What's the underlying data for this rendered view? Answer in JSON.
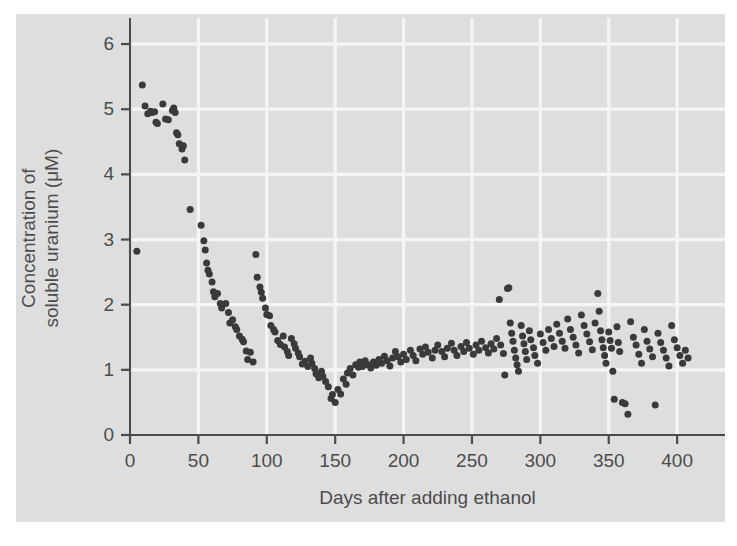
{
  "figure": {
    "background_color": "#ffffff",
    "panel_color": "#dedede",
    "grid_color": "#f5f5f5",
    "axis_color": "#4c4c4c",
    "point_color": "#3a3a3a"
  },
  "axes": {
    "x_title": "Days after adding ethanol",
    "y_title_line1": "Concentration of",
    "y_title_line2": "soluble uranium (μM)",
    "x_ticks": [
      "0",
      "50",
      "100",
      "150",
      "200",
      "250",
      "300",
      "350",
      "400"
    ],
    "y_ticks": [
      "0",
      "1",
      "2",
      "3",
      "4",
      "5",
      "6"
    ]
  },
  "chart_data": {
    "type": "scatter",
    "title": "",
    "xlabel": "Days after adding ethanol",
    "ylabel": "Concentration of soluble uranium (μM)",
    "xlim": [
      0,
      435
    ],
    "ylim": [
      0,
      6.4
    ],
    "xticks": [
      0,
      50,
      100,
      150,
      200,
      250,
      300,
      350,
      400
    ],
    "yticks": [
      0,
      1,
      2,
      3,
      4,
      5,
      6
    ],
    "grid": true,
    "legend": null,
    "marker": "filled-circle",
    "marker_size_px": 7,
    "series": [
      {
        "name": "soluble uranium",
        "color": "#3a3a3a",
        "points": [
          [
            5,
            2.82
          ],
          [
            9,
            5.37
          ],
          [
            11,
            5.05
          ],
          [
            13,
            4.93
          ],
          [
            15,
            4.97
          ],
          [
            16,
            4.95
          ],
          [
            18,
            4.96
          ],
          [
            19,
            4.8
          ],
          [
            20,
            4.78
          ],
          [
            24,
            5.08
          ],
          [
            26,
            4.85
          ],
          [
            28,
            4.84
          ],
          [
            31,
            4.98
          ],
          [
            32,
            5.02
          ],
          [
            33,
            4.95
          ],
          [
            34,
            4.64
          ],
          [
            35,
            4.61
          ],
          [
            36,
            4.47
          ],
          [
            38,
            4.39
          ],
          [
            39,
            4.44
          ],
          [
            40,
            4.22
          ],
          [
            44,
            3.46
          ],
          [
            52,
            3.22
          ],
          [
            54,
            2.98
          ],
          [
            55,
            2.84
          ],
          [
            56,
            2.64
          ],
          [
            57,
            2.53
          ],
          [
            58,
            2.47
          ],
          [
            60,
            2.35
          ],
          [
            61,
            2.2
          ],
          [
            62,
            2.12
          ],
          [
            64,
            2.17
          ],
          [
            66,
            2.02
          ],
          [
            67,
            1.95
          ],
          [
            70,
            2.02
          ],
          [
            72,
            1.88
          ],
          [
            73,
            1.72
          ],
          [
            75,
            1.77
          ],
          [
            77,
            1.66
          ],
          [
            78,
            1.62
          ],
          [
            80,
            1.52
          ],
          [
            82,
            1.47
          ],
          [
            83,
            1.43
          ],
          [
            85,
            1.29
          ],
          [
            86,
            1.16
          ],
          [
            88,
            1.27
          ],
          [
            90,
            1.12
          ],
          [
            92,
            2.77
          ],
          [
            93,
            2.42
          ],
          [
            95,
            2.27
          ],
          [
            96,
            2.19
          ],
          [
            97,
            2.1
          ],
          [
            99,
            1.95
          ],
          [
            100,
            1.85
          ],
          [
            102,
            1.83
          ],
          [
            103,
            1.68
          ],
          [
            105,
            1.62
          ],
          [
            106,
            1.58
          ],
          [
            108,
            1.45
          ],
          [
            110,
            1.39
          ],
          [
            112,
            1.52
          ],
          [
            113,
            1.35
          ],
          [
            115,
            1.28
          ],
          [
            116,
            1.22
          ],
          [
            118,
            1.48
          ],
          [
            120,
            1.4
          ],
          [
            121,
            1.33
          ],
          [
            123,
            1.26
          ],
          [
            124,
            1.2
          ],
          [
            126,
            1.09
          ],
          [
            128,
            1.13
          ],
          [
            130,
            1.05
          ],
          [
            132,
            1.18
          ],
          [
            133,
            1.1
          ],
          [
            135,
            1.02
          ],
          [
            136,
            0.94
          ],
          [
            138,
            0.88
          ],
          [
            140,
            0.98
          ],
          [
            141,
            0.9
          ],
          [
            143,
            0.82
          ],
          [
            145,
            0.74
          ],
          [
            147,
            0.56
          ],
          [
            148,
            0.62
          ],
          [
            150,
            0.5
          ],
          [
            152,
            0.7
          ],
          [
            154,
            0.63
          ],
          [
            156,
            0.86
          ],
          [
            158,
            0.78
          ],
          [
            159,
            0.95
          ],
          [
            161,
            1.02
          ],
          [
            163,
            0.92
          ],
          [
            165,
            1.08
          ],
          [
            167,
            1.04
          ],
          [
            168,
            1.12
          ],
          [
            170,
            1.05
          ],
          [
            172,
            1.14
          ],
          [
            174,
            1.08
          ],
          [
            176,
            1.03
          ],
          [
            178,
            1.12
          ],
          [
            180,
            1.07
          ],
          [
            182,
            1.16
          ],
          [
            184,
            1.1
          ],
          [
            186,
            1.21
          ],
          [
            188,
            1.14
          ],
          [
            190,
            1.06
          ],
          [
            192,
            1.18
          ],
          [
            194,
            1.28
          ],
          [
            196,
            1.2
          ],
          [
            198,
            1.12
          ],
          [
            200,
            1.24
          ],
          [
            202,
            1.16
          ],
          [
            205,
            1.3
          ],
          [
            207,
            1.22
          ],
          [
            209,
            1.14
          ],
          [
            212,
            1.32
          ],
          [
            214,
            1.24
          ],
          [
            216,
            1.35
          ],
          [
            218,
            1.27
          ],
          [
            221,
            1.18
          ],
          [
            223,
            1.3
          ],
          [
            225,
            1.38
          ],
          [
            228,
            1.28
          ],
          [
            230,
            1.2
          ],
          [
            232,
            1.33
          ],
          [
            235,
            1.41
          ],
          [
            237,
            1.3
          ],
          [
            239,
            1.22
          ],
          [
            242,
            1.36
          ],
          [
            244,
            1.28
          ],
          [
            246,
            1.42
          ],
          [
            248,
            1.33
          ],
          [
            251,
            1.24
          ],
          [
            253,
            1.38
          ],
          [
            255,
            1.3
          ],
          [
            257,
            1.44
          ],
          [
            260,
            1.34
          ],
          [
            262,
            1.26
          ],
          [
            264,
            1.4
          ],
          [
            266,
            1.32
          ],
          [
            268,
            1.48
          ],
          [
            270,
            2.08
          ],
          [
            271,
            1.38
          ],
          [
            273,
            1.25
          ],
          [
            274,
            0.92
          ],
          [
            276,
            2.25
          ],
          [
            277,
            2.26
          ],
          [
            278,
            1.72
          ],
          [
            279,
            1.56
          ],
          [
            280,
            1.44
          ],
          [
            281,
            1.3
          ],
          [
            282,
            1.18
          ],
          [
            283,
            1.08
          ],
          [
            284,
            0.98
          ],
          [
            286,
            1.68
          ],
          [
            287,
            1.52
          ],
          [
            288,
            1.4
          ],
          [
            289,
            1.28
          ],
          [
            290,
            1.16
          ],
          [
            292,
            1.6
          ],
          [
            293,
            1.46
          ],
          [
            295,
            1.34
          ],
          [
            296,
            1.22
          ],
          [
            298,
            1.1
          ],
          [
            300,
            1.55
          ],
          [
            302,
            1.42
          ],
          [
            304,
            1.3
          ],
          [
            306,
            1.62
          ],
          [
            308,
            1.48
          ],
          [
            310,
            1.36
          ],
          [
            312,
            1.7
          ],
          [
            314,
            1.56
          ],
          [
            316,
            1.44
          ],
          [
            318,
            1.33
          ],
          [
            320,
            1.78
          ],
          [
            322,
            1.62
          ],
          [
            324,
            1.5
          ],
          [
            326,
            1.38
          ],
          [
            328,
            1.26
          ],
          [
            330,
            1.84
          ],
          [
            332,
            1.68
          ],
          [
            334,
            1.55
          ],
          [
            336,
            1.43
          ],
          [
            338,
            1.31
          ],
          [
            340,
            1.72
          ],
          [
            342,
            2.17
          ],
          [
            343,
            1.9
          ],
          [
            344,
            1.6
          ],
          [
            345,
            1.46
          ],
          [
            346,
            1.34
          ],
          [
            347,
            1.22
          ],
          [
            348,
            1.1
          ],
          [
            350,
            1.58
          ],
          [
            351,
            1.45
          ],
          [
            352,
            1.33
          ],
          [
            353,
            0.98
          ],
          [
            354,
            0.55
          ],
          [
            356,
            1.66
          ],
          [
            357,
            1.42
          ],
          [
            358,
            1.28
          ],
          [
            360,
            0.5
          ],
          [
            362,
            0.48
          ],
          [
            364,
            0.32
          ],
          [
            366,
            1.74
          ],
          [
            368,
            1.5
          ],
          [
            370,
            1.38
          ],
          [
            372,
            1.24
          ],
          [
            374,
            1.1
          ],
          [
            376,
            1.62
          ],
          [
            378,
            1.44
          ],
          [
            380,
            1.32
          ],
          [
            382,
            1.2
          ],
          [
            384,
            0.46
          ],
          [
            386,
            1.56
          ],
          [
            388,
            1.42
          ],
          [
            390,
            1.3
          ],
          [
            392,
            1.18
          ],
          [
            394,
            1.06
          ],
          [
            396,
            1.68
          ],
          [
            398,
            1.46
          ],
          [
            400,
            1.34
          ],
          [
            402,
            1.22
          ],
          [
            404,
            1.1
          ],
          [
            406,
            1.3
          ],
          [
            408,
            1.18
          ]
        ]
      }
    ]
  }
}
